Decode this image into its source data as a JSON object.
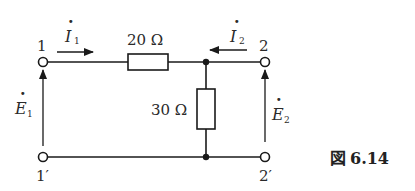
{
  "diagram": {
    "type": "two-port circuit",
    "caption": {
      "prefix": "図",
      "number": "6.14"
    },
    "terminals": {
      "t1": "1",
      "t1p": "1′",
      "t2": "2",
      "t2p": "2′"
    },
    "components": {
      "series_resistor": {
        "label": "20 Ω",
        "value": "20",
        "unit": "Ω"
      },
      "shunt_resistor": {
        "label": "30 Ω",
        "value": "30",
        "unit": "Ω"
      }
    },
    "currents": {
      "i1": {
        "symbol": "I",
        "subscript": "1",
        "dot": "·",
        "direction": "right"
      },
      "i2": {
        "symbol": "I",
        "subscript": "2",
        "dot": "·",
        "direction": "left"
      }
    },
    "voltages": {
      "e1": {
        "symbol": "E",
        "subscript": "1",
        "dot": "·",
        "direction": "up"
      },
      "e2": {
        "symbol": "E",
        "subscript": "2",
        "dot": "·",
        "direction": "up"
      }
    },
    "colors": {
      "line": "#1a1a1a",
      "text": "#2a2a2a",
      "background": "#ffffff"
    }
  }
}
